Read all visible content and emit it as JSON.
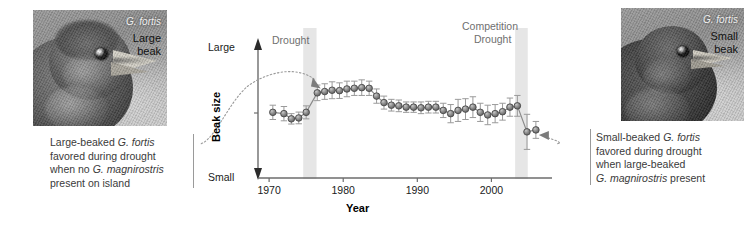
{
  "photos": {
    "left": {
      "species": "G. fortis",
      "descriptor_line1": "Large",
      "descriptor_line2": "beak",
      "alt": "grayscale photograph of a large-beaked Galapagos ground finch in profile"
    },
    "right": {
      "species": "G. fortis",
      "descriptor_line1": "Small",
      "descriptor_line2": "beak",
      "alt": "grayscale photograph of a small-beaked Galapagos ground finch in profile"
    }
  },
  "captions": {
    "left": {
      "line1_a": "Large-beaked ",
      "line1_sci": "G. fortis",
      "line2": "favored during drought",
      "line3_a": "when no ",
      "line3_sci": "G. magnirostris",
      "line4": "present on island"
    },
    "right": {
      "line1_a": "Small-beaked ",
      "line1_sci": "G. fortis",
      "line2": "favored during drought",
      "line3": "when large-beaked",
      "line4_sci": "G. magnirostris",
      "line4_b": " present"
    }
  },
  "chart_data": {
    "type": "line",
    "title": "",
    "xlabel": "Year",
    "ylabel": "Beak size",
    "xlim": [
      1968.5,
      2007.5
    ],
    "ylim": [
      0,
      10
    ],
    "grid": false,
    "legend": null,
    "y_axis_labels": {
      "top": "Large",
      "bottom": "Small"
    },
    "x_ticks": [
      1970,
      1980,
      1990,
      2000
    ],
    "y_ticks_unlabeled": [
      5
    ],
    "error_bars": true,
    "marker": "filled-circle-gray",
    "annotations": [
      {
        "label": "Drought",
        "type": "band-label",
        "x": 1975.5
      },
      {
        "label": "Competition",
        "type": "band-label",
        "x": 2004.0
      },
      {
        "label": "Drought",
        "type": "band-label",
        "x": 2004.0
      }
    ],
    "shaded_bands": [
      {
        "label": "Drought",
        "x_start": 1974.6,
        "x_end": 1976.4
      },
      {
        "label": "Competition Drought",
        "x_start": 2003.2,
        "x_end": 2004.9
      }
    ],
    "x": [
      1970.5,
      1972,
      1973,
      1974,
      1975,
      1976.5,
      1977.5,
      1978.5,
      1979.5,
      1980.5,
      1981.5,
      1982.5,
      1983.5,
      1984.5,
      1985.5,
      1986.5,
      1987.5,
      1988.5,
      1989.5,
      1990.5,
      1991.5,
      1992.5,
      1993.5,
      1994.5,
      1995.5,
      1996.5,
      1997.5,
      1998.5,
      1999.5,
      2000.5,
      2001.5,
      2002.5,
      2003.5,
      2004.8,
      2006.0
    ],
    "y": [
      5.05,
      4.95,
      4.55,
      4.62,
      5.05,
      6.55,
      6.65,
      6.75,
      6.72,
      6.85,
      6.9,
      6.95,
      6.9,
      6.3,
      5.8,
      5.6,
      5.55,
      5.45,
      5.45,
      5.4,
      5.45,
      5.45,
      5.2,
      4.95,
      5.2,
      5.3,
      5.45,
      5.05,
      4.85,
      4.95,
      5.1,
      5.45,
      5.55,
      3.55,
      3.7
    ],
    "yerr": [
      0.55,
      0.55,
      0.4,
      0.45,
      0.5,
      0.6,
      0.6,
      0.65,
      0.6,
      0.6,
      0.55,
      0.6,
      0.55,
      0.55,
      0.5,
      0.45,
      0.45,
      0.4,
      0.4,
      0.45,
      0.45,
      0.45,
      0.55,
      0.7,
      0.85,
      0.8,
      0.8,
      0.7,
      0.75,
      0.7,
      0.65,
      0.7,
      0.8,
      1.35,
      0.65
    ],
    "series_name": "Mean beak size of G. fortis"
  },
  "colors": {
    "marker_fill": "#8f8f8f",
    "marker_stroke": "#4a4a4a",
    "error_bar": "#9a9a9a",
    "band_fill": "#e6e6e6",
    "axis": "#6d6d6d",
    "caption_text": "#3a3a3a",
    "band_label": "#6f6f6f"
  }
}
